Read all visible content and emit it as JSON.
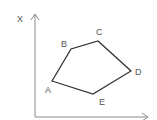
{
  "diagram": {
    "axis_label_y": "X",
    "axes": {
      "color": "#8a8a8a",
      "origin": [
        35,
        117
      ],
      "y_top": 14,
      "x_right": 148
    },
    "polygon": {
      "stroke": "#333333",
      "vertices": [
        {
          "label": "A",
          "x": 52,
          "y": 81,
          "lx": 45,
          "ly": 93
        },
        {
          "label": "B",
          "x": 71,
          "y": 49,
          "lx": 61,
          "ly": 47
        },
        {
          "label": "C",
          "x": 98,
          "y": 41,
          "lx": 96,
          "ly": 35
        },
        {
          "label": "D",
          "x": 131,
          "y": 71,
          "lx": 135,
          "ly": 75
        },
        {
          "label": "E",
          "x": 93,
          "y": 94,
          "lx": 99,
          "ly": 105
        }
      ]
    }
  }
}
